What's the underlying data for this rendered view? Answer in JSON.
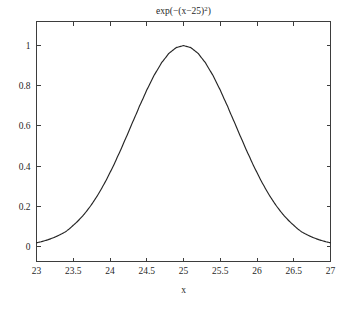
{
  "figure": {
    "background_color": "#ffffff",
    "axis_color": "#3d3d3d",
    "curve_color": "#262626",
    "text_color": "#1f1f1f"
  },
  "title": {
    "full": "exp(-(x-25)^2)",
    "prefix": "exp(−(x−25)",
    "exponent": "2",
    "suffix": ")"
  },
  "axes": {
    "x_label": "x",
    "y_label": "",
    "x_ticks": [
      "23",
      "23.5",
      "24",
      "24.5",
      "25",
      "25.5",
      "26",
      "26.5",
      "27"
    ],
    "y_ticks": [
      "0",
      "0.2",
      "0.4",
      "0.6",
      "0.8",
      "1"
    ]
  },
  "chart_data": {
    "type": "line",
    "xlabel": "x",
    "ylabel": "",
    "xlim": [
      23,
      27
    ],
    "ylim": [
      -0.075,
      1.12
    ],
    "grid": false,
    "legend": false,
    "x_ticks": [
      23,
      23.5,
      24,
      24.5,
      25,
      25.5,
      26,
      26.5,
      27
    ],
    "y_ticks": [
      0,
      0.2,
      0.4,
      0.6,
      0.8,
      1
    ],
    "series": [
      {
        "name": "exp(-(x-25)^2)",
        "color": "#262626",
        "x": [
          23,
          23.1,
          23.2,
          23.3,
          23.4,
          23.5,
          23.6,
          23.7,
          23.8,
          23.9,
          24,
          24.1,
          24.2,
          24.3,
          24.4,
          24.5,
          24.6,
          24.7,
          24.8,
          24.9,
          25,
          25.1,
          25.2,
          25.3,
          25.4,
          25.5,
          25.6,
          25.7,
          25.8,
          25.9,
          26,
          26.1,
          26.2,
          26.3,
          26.4,
          26.5,
          26.6,
          26.7,
          26.8,
          26.9,
          27
        ],
        "y": [
          0.0183,
          0.0273,
          0.0392,
          0.0549,
          0.0747,
          0.1054,
          0.1409,
          0.1845,
          0.2369,
          0.2982,
          0.3679,
          0.4449,
          0.5273,
          0.6126,
          0.6977,
          0.7788,
          0.8521,
          0.9139,
          0.9608,
          0.99,
          1.0,
          0.99,
          0.9608,
          0.9139,
          0.8521,
          0.7788,
          0.6977,
          0.6126,
          0.5273,
          0.4449,
          0.3679,
          0.2982,
          0.2369,
          0.1845,
          0.1409,
          0.1054,
          0.0747,
          0.0549,
          0.0392,
          0.0273,
          0.0183
        ]
      }
    ]
  }
}
